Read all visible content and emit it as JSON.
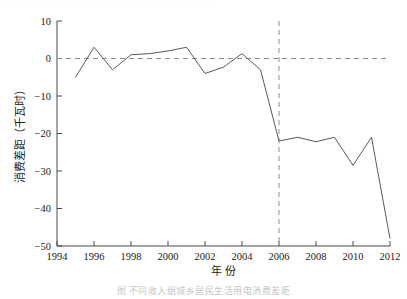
{
  "figure": {
    "caption": "图      不同收入组城乡居民生活用电消费差距",
    "top_partial_text": "· · · · · · · · · · · · · · · · · · · · · · · ·"
  },
  "chart_data": {
    "type": "line",
    "title": "",
    "xlabel": "年 份",
    "ylabel": "消费差距（千瓦时）",
    "xlim": [
      1994,
      2012
    ],
    "ylim": [
      -50,
      10
    ],
    "xticks": [
      1994,
      1996,
      1998,
      2000,
      2002,
      2004,
      2006,
      2008,
      2010,
      2012
    ],
    "yticks": [
      10,
      0,
      -10,
      -20,
      -30,
      -40,
      -50
    ],
    "xtick_labels": [
      "1994",
      "1996",
      "1998",
      "2000",
      "2002",
      "2004",
      "2006",
      "2008",
      "2010",
      "2012"
    ],
    "ytick_labels": [
      "10",
      "0",
      "-10",
      "-20",
      "-30",
      "-40",
      "-50"
    ],
    "grid": false,
    "legend": null,
    "line_color": "#5a5a5a",
    "reference_lines": [
      {
        "name": "zero-reference-line",
        "orientation": "horizontal",
        "value": 0,
        "style": "dashed",
        "color": "#8e8e8e"
      },
      {
        "name": "year-2006-marker-line",
        "orientation": "vertical",
        "value": 2006,
        "style": "dashed",
        "color": "#8e8e8e"
      }
    ],
    "x": [
      1995,
      1996,
      1997,
      1998,
      1999,
      2000,
      2001,
      2002,
      2003,
      2004,
      2005,
      2006,
      2007,
      2008,
      2009,
      2010,
      2011,
      2012
    ],
    "values": [
      -5.0,
      3.0,
      -3.0,
      1.0,
      1.3,
      2.0,
      3.0,
      -4.0,
      -2.3,
      1.3,
      -3.0,
      -22.0,
      -21.0,
      -22.2,
      -21.0,
      -28.5,
      -21.0,
      -48.0
    ],
    "series": [
      {
        "name": "消费差距",
        "values": [
          -5.0,
          3.0,
          -3.0,
          1.0,
          1.3,
          2.0,
          3.0,
          -4.0,
          -2.3,
          1.3,
          -3.0,
          -22.0,
          -21.0,
          -22.2,
          -21.0,
          -28.5,
          -21.0,
          -48.0
        ]
      }
    ]
  }
}
